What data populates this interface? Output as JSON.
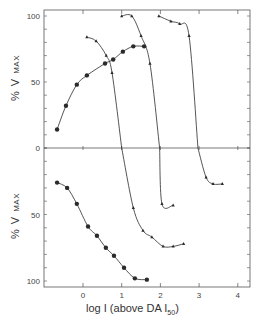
{
  "chart_data": {
    "type": "line",
    "title": "",
    "xlabel": "log I (above DA I50)",
    "xlabel_main": "log I (above DA I",
    "xlabel_sub": "50",
    "xlabel_close": ")",
    "ylabel_top": "% V",
    "ylabel_top_sub": "MAX",
    "ylabel_bottom": "% V",
    "ylabel_bottom_sub": "MAX",
    "xlim": [
      -1.0,
      4.3
    ],
    "x_ticks": [
      0,
      1,
      2,
      3,
      4
    ],
    "panels": [
      {
        "name": "top",
        "ylim": [
          0,
          100
        ],
        "y_ticks": [
          0,
          50,
          100
        ],
        "series": [
          {
            "name": "circles (activation)",
            "marker": "circle",
            "x": [
              -0.67,
              -0.44,
              -0.16,
              0.1,
              0.57,
              0.78,
              1.03,
              1.3,
              1.58
            ],
            "y": [
              14,
              32,
              48,
              55,
              64,
              67,
              73,
              77,
              77
            ]
          },
          {
            "name": "triangles A",
            "marker": "triangle",
            "x": [
              0.1,
              0.34,
              0.6,
              0.75,
              1.0
            ],
            "y": [
              84,
              81,
              70,
              57,
              0
            ]
          },
          {
            "name": "triangles B",
            "marker": "triangle",
            "x": [
              1.0,
              1.26,
              1.5,
              1.73,
              1.98
            ],
            "y": [
              100,
              100,
              85,
              64,
              0
            ]
          },
          {
            "name": "triangles C",
            "marker": "triangle",
            "x": [
              1.96,
              2.27,
              2.5,
              2.74,
              2.97
            ],
            "y": [
              100,
              96,
              94,
              85,
              0
            ]
          }
        ]
      },
      {
        "name": "bottom (inverted axis)",
        "ylim": [
          100,
          0
        ],
        "y_ticks": [
          50,
          100
        ],
        "series": [
          {
            "name": "circles (inhibition)",
            "marker": "circle",
            "x": [
              -0.67,
              -0.41,
              -0.16,
              0.13,
              0.36,
              0.59,
              0.8,
              1.06,
              1.34,
              1.65
            ],
            "y": [
              26,
              30,
              42,
              59,
              66,
              75,
              81,
              90,
              98,
              99
            ]
          },
          {
            "name": "triangles A",
            "marker": "triangle",
            "x": [
              1.0,
              1.3,
              1.55,
              1.78,
              2.07,
              2.33,
              2.6
            ],
            "y": [
              0,
              45,
              62,
              67,
              74,
              74,
              72
            ]
          },
          {
            "name": "triangles B",
            "marker": "triangle",
            "x": [
              1.98,
              2.04,
              2.33
            ],
            "y": [
              0,
              42,
              43
            ]
          },
          {
            "name": "triangles C",
            "marker": "triangle",
            "x": [
              2.97,
              3.18,
              3.36,
              3.6
            ],
            "y": [
              0,
              22,
              27,
              27
            ]
          }
        ]
      }
    ],
    "grid": false,
    "legend": "none"
  },
  "colors": {
    "ink": "#2a2a2a",
    "background": "#ffffff"
  }
}
